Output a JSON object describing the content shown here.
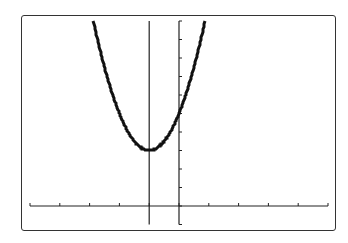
{
  "chart_data": {
    "type": "line",
    "title": "",
    "xlabel": "",
    "ylabel": "",
    "xlim": [
      -5,
      5
    ],
    "ylim": [
      -1,
      10
    ],
    "x_tick_step": 1,
    "y_tick_step": 1,
    "grid": false,
    "series": [
      {
        "name": "y = 2(x+1)^2 + 3",
        "function": "2*(x+1)^2+3",
        "x": [
          -2.87,
          -2.5,
          -2,
          -1.5,
          -1,
          -0.5,
          0,
          0.5,
          0.87
        ],
        "values": [
          10,
          7.5,
          5,
          3.5,
          3,
          3.5,
          5,
          7.5,
          10
        ]
      }
    ],
    "annotations": [
      {
        "type": "vertical-line",
        "x": -1,
        "label": "axis of symmetry / trace line"
      }
    ],
    "vertex": [
      -1,
      3
    ],
    "y_intercept": 5
  },
  "colors": {
    "curve": "#111111",
    "axes": "#222222",
    "frame": "#333333",
    "background": "#ffffff"
  }
}
